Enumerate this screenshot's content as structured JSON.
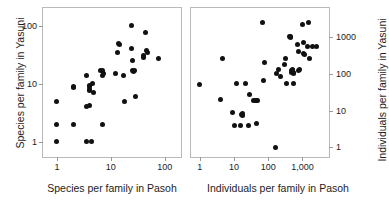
{
  "figure": {
    "background": "#ffffff",
    "point_color": "#111111",
    "frame_color": "#b9b9b9",
    "panel_count": 2
  },
  "chart_data": [
    {
      "id": "left-panel",
      "type": "scatter",
      "title": "",
      "xlabel": "Species per family in Pasoh",
      "ylabel": "Species per family in Yasuni",
      "xscale": "log",
      "yscale": "log",
      "xlim": [
        0.55,
        200
      ],
      "ylim": [
        0.55,
        200
      ],
      "xticks": [
        1,
        10,
        100
      ],
      "xticklabels": [
        "1",
        "10",
        "100"
      ],
      "yticks": [
        1,
        10,
        100
      ],
      "yticklabels": [
        "1",
        "10",
        "100"
      ],
      "grid": false,
      "legend": "none",
      "points": [
        [
          1,
          5
        ],
        [
          1,
          2
        ],
        [
          1,
          1
        ],
        [
          2,
          9
        ],
        [
          2,
          8.5
        ],
        [
          2,
          2
        ],
        [
          3.5,
          14
        ],
        [
          3.5,
          4
        ],
        [
          3.5,
          1
        ],
        [
          4,
          9.5
        ],
        [
          4,
          8
        ],
        [
          4,
          7.5
        ],
        [
          4,
          8.8
        ],
        [
          4,
          4.3
        ],
        [
          4.3,
          1
        ],
        [
          4.6,
          10
        ],
        [
          4.8,
          7
        ],
        [
          6.5,
          17
        ],
        [
          7,
          17
        ],
        [
          7,
          14
        ],
        [
          7.2,
          15
        ],
        [
          7,
          2
        ],
        [
          12,
          15
        ],
        [
          13,
          35
        ],
        [
          14,
          50
        ],
        [
          14.5,
          48
        ],
        [
          17,
          14
        ],
        [
          18,
          5
        ],
        [
          24,
          100
        ],
        [
          24,
          40
        ],
        [
          25,
          25
        ],
        [
          25,
          17
        ],
        [
          26,
          16.5
        ],
        [
          27,
          17
        ],
        [
          29,
          6
        ],
        [
          40,
          30
        ],
        [
          41,
          28
        ],
        [
          44,
          75
        ],
        [
          46,
          37
        ],
        [
          48,
          35
        ],
        [
          78,
          27
        ]
      ]
    },
    {
      "id": "right-panel",
      "type": "scatter",
      "title": "",
      "xlabel": "Individuals per family in Pasoh",
      "ylabel": "Individuals per family in Yasuni",
      "xscale": "log",
      "yscale": "log",
      "xlim": [
        0.55,
        6000
      ],
      "ylim": [
        0.55,
        6000
      ],
      "xticks": [
        1,
        10,
        100,
        1000
      ],
      "xticklabels": [
        "1",
        "10",
        "100",
        "1,000"
      ],
      "yticks": [
        1,
        10,
        100,
        1000
      ],
      "yticklabels": [
        "1",
        "10",
        "100",
        "1000"
      ],
      "grid": false,
      "legend": "none",
      "points": [
        [
          1,
          50
        ],
        [
          4,
          20
        ],
        [
          4.5,
          250
        ],
        [
          9,
          9
        ],
        [
          10,
          4
        ],
        [
          12,
          55
        ],
        [
          15,
          4
        ],
        [
          17,
          8
        ],
        [
          18,
          7.5
        ],
        [
          18,
          8.5
        ],
        [
          22,
          55
        ],
        [
          26,
          4
        ],
        [
          28,
          28
        ],
        [
          38,
          19
        ],
        [
          42,
          19
        ],
        [
          45,
          19
        ],
        [
          48,
          19
        ],
        [
          44,
          4.5
        ],
        [
          70,
          2500
        ],
        [
          75,
          65
        ],
        [
          80,
          200
        ],
        [
          160,
          1
        ],
        [
          180,
          100
        ],
        [
          200,
          130
        ],
        [
          230,
          85
        ],
        [
          300,
          180
        ],
        [
          330,
          250
        ],
        [
          350,
          55
        ],
        [
          420,
          1000
        ],
        [
          450,
          1000
        ],
        [
          460,
          980
        ],
        [
          470,
          110
        ],
        [
          480,
          120
        ],
        [
          500,
          130
        ],
        [
          520,
          120
        ],
        [
          540,
          105
        ],
        [
          560,
          55
        ],
        [
          560,
          100
        ],
        [
          700,
          600
        ],
        [
          750,
          400
        ],
        [
          780,
          120
        ],
        [
          800,
          130
        ],
        [
          1000,
          2200
        ],
        [
          1050,
          700
        ],
        [
          1100,
          350
        ],
        [
          1150,
          330
        ],
        [
          1400,
          550
        ],
        [
          1500,
          2400
        ],
        [
          1600,
          250
        ],
        [
          2000,
          550
        ],
        [
          2600,
          550
        ]
      ]
    }
  ]
}
